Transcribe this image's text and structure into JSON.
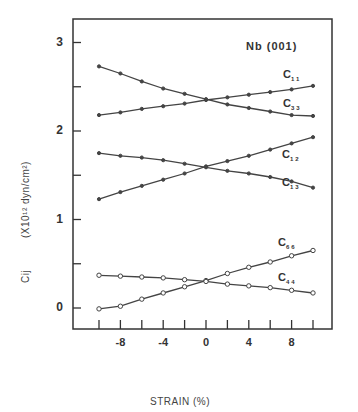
{
  "chart_data": {
    "type": "line",
    "title": "Nb (001)",
    "xlabel": "STRAIN (%)",
    "ylabel": "Cij (X10^12 dyn/cm^2)",
    "ylabel_parts": {
      "symbol": "Cij",
      "unit": "(X10¹² dyn/cm²)"
    },
    "x": [
      -10,
      -8,
      -6,
      -4,
      -2,
      0,
      2,
      4,
      6,
      8,
      10
    ],
    "xlim": [
      -11.5,
      12
    ],
    "ylim": [
      -0.25,
      3.25
    ],
    "x_ticks": [
      -10,
      -8,
      -6,
      -4,
      -2,
      0,
      2,
      4,
      6,
      8,
      10
    ],
    "x_tick_labels": [
      {
        "value": -8,
        "label": "-8"
      },
      {
        "value": -4,
        "label": "-4"
      },
      {
        "value": 0,
        "label": "0"
      },
      {
        "value": 4,
        "label": "4"
      },
      {
        "value": 8,
        "label": "8"
      }
    ],
    "y_ticks": [
      0,
      0.5,
      1,
      1.5,
      2,
      2.5,
      3
    ],
    "y_tick_labels": [
      {
        "value": 0,
        "label": "0"
      },
      {
        "value": 1,
        "label": "1"
      },
      {
        "value": 2,
        "label": "2"
      },
      {
        "value": 3,
        "label": "3"
      }
    ],
    "grid": false,
    "legend_position": "inline labels at right end of each curve",
    "series": [
      {
        "name": "C11",
        "label_main": "C",
        "label_sub": "11",
        "marker": "filled",
        "values": [
          2.18,
          2.21,
          2.25,
          2.28,
          2.31,
          2.35,
          2.38,
          2.41,
          2.44,
          2.47,
          2.51
        ]
      },
      {
        "name": "C33",
        "label_main": "C",
        "label_sub": "33",
        "marker": "filled",
        "values": [
          2.73,
          2.65,
          2.56,
          2.48,
          2.42,
          2.36,
          2.3,
          2.26,
          2.22,
          2.18,
          2.17
        ]
      },
      {
        "name": "C12",
        "label_main": "C",
        "label_sub": "12",
        "marker": "filled",
        "values": [
          1.23,
          1.31,
          1.38,
          1.45,
          1.52,
          1.6,
          1.66,
          1.72,
          1.79,
          1.86,
          1.93
        ]
      },
      {
        "name": "C13",
        "label_main": "C",
        "label_sub": "13",
        "marker": "filled",
        "values": [
          1.75,
          1.72,
          1.7,
          1.67,
          1.63,
          1.59,
          1.55,
          1.52,
          1.48,
          1.43,
          1.36
        ]
      },
      {
        "name": "C66",
        "label_main": "C",
        "label_sub": "66",
        "marker": "open",
        "values": [
          -0.01,
          0.02,
          0.1,
          0.17,
          0.24,
          0.31,
          0.39,
          0.46,
          0.52,
          0.59,
          0.65
        ]
      },
      {
        "name": "C44",
        "label_main": "C",
        "label_sub": "44",
        "marker": "open",
        "values": [
          0.37,
          0.36,
          0.35,
          0.34,
          0.32,
          0.3,
          0.27,
          0.25,
          0.23,
          0.2,
          0.17
        ]
      }
    ],
    "colors": {
      "line": "#444444",
      "frame": "#333333",
      "text": "#333333"
    }
  }
}
